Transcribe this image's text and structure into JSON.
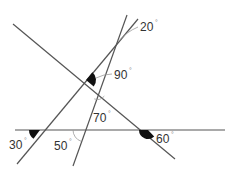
{
  "diagram": {
    "title": "",
    "lines": [
      {
        "id": "horizontal",
        "x1": 15,
        "y1": 130,
        "x2": 225,
        "y2": 130
      },
      {
        "id": "diagonal",
        "x1": 13,
        "y1": 24,
        "x2": 175,
        "y2": 159
      },
      {
        "id": "steep-left",
        "x1": 17,
        "y1": 164,
        "x2": 138,
        "y2": 19
      },
      {
        "id": "near-vertical",
        "x1": 73,
        "y1": 166,
        "x2": 127,
        "y2": 15
      }
    ],
    "angles": [
      {
        "id": "angle-20",
        "value": "20",
        "unit": "°",
        "marker": "leader"
      },
      {
        "id": "angle-90",
        "value": "90",
        "unit": "°",
        "marker": "filled"
      },
      {
        "id": "angle-70",
        "value": "70",
        "unit": "°",
        "marker": "arc"
      },
      {
        "id": "angle-30",
        "value": "30",
        "unit": "°",
        "marker": "filled"
      },
      {
        "id": "angle-50",
        "value": "50",
        "unit": "°",
        "marker": "arc"
      },
      {
        "id": "angle-60",
        "value": "60",
        "unit": "°",
        "marker": "filled"
      }
    ],
    "colors": {
      "line": "#555555",
      "wedge": "#111111",
      "label": "#333333"
    }
  }
}
